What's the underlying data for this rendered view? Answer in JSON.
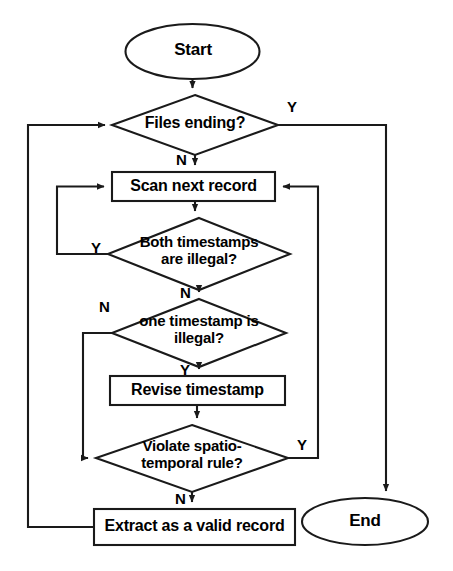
{
  "diagram": {
    "type": "flowchart",
    "nodes": {
      "start": {
        "label": "Start",
        "shape": "ellipse"
      },
      "files_ending": {
        "label": "Files ending?",
        "shape": "diamond"
      },
      "scan_next_record": {
        "label": "Scan next record",
        "shape": "process"
      },
      "both_timestamps_illegal": {
        "label": "Both timestamps\nare illegal?",
        "shape": "diamond"
      },
      "one_timestamp_illegal": {
        "label": "one timestamp is\nillegal?",
        "shape": "diamond"
      },
      "revise_timestamp": {
        "label": "Revise timestamp",
        "shape": "process"
      },
      "violate_rule": {
        "label": "Violate spatio-\ntemporal rule?",
        "shape": "diamond"
      },
      "extract_valid_record": {
        "label": "Extract as a valid record",
        "shape": "process"
      },
      "end": {
        "label": "End",
        "shape": "ellipse"
      }
    },
    "edge_labels": {
      "files_ending_yes": "Y",
      "files_ending_no": "N",
      "both_illegal_yes": "Y",
      "both_illegal_no": "N",
      "one_illegal_no": "N",
      "one_illegal_yes": "Y",
      "violate_yes": "Y",
      "violate_no": "N"
    },
    "colors": {
      "stroke": "#1a1a1a",
      "fill": "#ffffff",
      "text": "#000000",
      "background": "#ffffff"
    }
  }
}
